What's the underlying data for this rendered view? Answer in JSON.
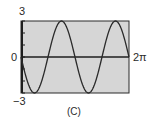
{
  "chart_data": {
    "type": "line",
    "title": "",
    "caption": "(C)",
    "xlabel": "",
    "ylabel": "",
    "x_range": [
      0,
      6.283185
    ],
    "x_tick_labels": [
      "2π"
    ],
    "y_tick_labels": [
      "3",
      "0",
      "−3"
    ],
    "ylim": [
      -3,
      3
    ],
    "grid": false,
    "legend": null,
    "series": [
      {
        "name": "y = -3 sin(2x)",
        "function": "-3*sin(2*x)",
        "amplitude": 3,
        "periods_shown": 2,
        "x": [
          0,
          0.785,
          1.571,
          2.356,
          3.142,
          3.927,
          4.712,
          5.498,
          6.283
        ],
        "y": [
          0,
          -3,
          0,
          3,
          0,
          -3,
          0,
          3,
          0
        ]
      }
    ],
    "colors": {
      "plot_background": "#d6d6d6",
      "frame": "#2b2b2b",
      "curve": "#2b2b2b",
      "axis": "#1e1e1e"
    }
  },
  "labels": {
    "y_max": "3",
    "y_zero": "0",
    "y_min": "−3",
    "x_max": "2π",
    "caption": "(C)"
  }
}
